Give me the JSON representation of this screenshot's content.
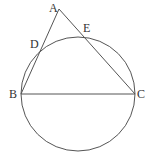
{
  "diagram": {
    "type": "geometry",
    "colors": {
      "stroke": "#555555",
      "label": "#333333",
      "background": "#ffffff"
    },
    "circle": {
      "cx": 78,
      "cy": 94,
      "r": 57
    },
    "points": {
      "A": {
        "label": "A",
        "x": 59,
        "y": 9,
        "lx": 49,
        "ly": 12
      },
      "B": {
        "label": "B",
        "x": 21,
        "y": 94,
        "lx": 9,
        "ly": 98
      },
      "C": {
        "label": "C",
        "x": 135,
        "y": 94,
        "lx": 137,
        "ly": 98
      },
      "D": {
        "label": "D",
        "x": 41,
        "y": 51,
        "lx": 30,
        "ly": 48
      },
      "E": {
        "label": "E",
        "x": 83,
        "y": 37,
        "lx": 83,
        "ly": 32
      }
    },
    "segments": [
      [
        "A",
        "B"
      ],
      [
        "A",
        "C"
      ],
      [
        "B",
        "C"
      ]
    ]
  }
}
